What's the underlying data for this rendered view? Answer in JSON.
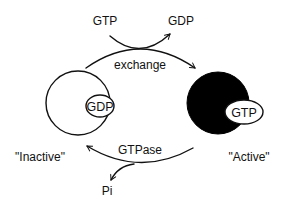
{
  "diagram": {
    "title": "",
    "top": {
      "input_label": "GTP",
      "output_label": "GDP",
      "process_label": "exchange"
    },
    "inactive": {
      "state_label": "\"Inactive\"",
      "bound_label": "GDP",
      "fill": "#ffffff"
    },
    "active": {
      "state_label": "\"Active\"",
      "bound_label": "GTP",
      "fill": "#000000"
    },
    "bottom": {
      "process_label": "GTPase",
      "product_label": "Pi"
    }
  },
  "colors": {
    "ink": "#111111",
    "background": "#ffffff"
  }
}
